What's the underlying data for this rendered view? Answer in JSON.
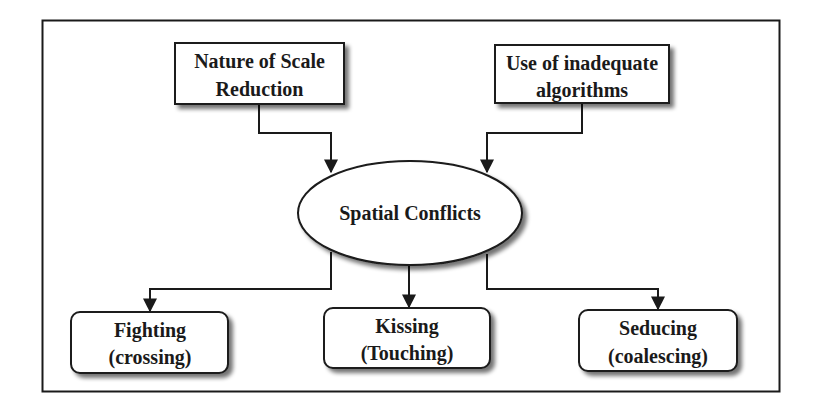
{
  "diagram": {
    "type": "flowchart",
    "center": {
      "label": "Spatial Conflicts"
    },
    "causes": [
      {
        "line1": "Nature of Scale",
        "line2": "Reduction"
      },
      {
        "line1": "Use of inadequate",
        "line2": "algorithms"
      }
    ],
    "types": [
      {
        "line1": "Fighting",
        "line2": "(crossing)"
      },
      {
        "line1": "Kissing",
        "line2": "(Touching)"
      },
      {
        "line1": "Seducing",
        "line2": "(coalescing)"
      }
    ],
    "colors": {
      "stroke": "#1a1a1a",
      "fill": "#ffffff",
      "shadow": "#9a9a9a"
    }
  }
}
